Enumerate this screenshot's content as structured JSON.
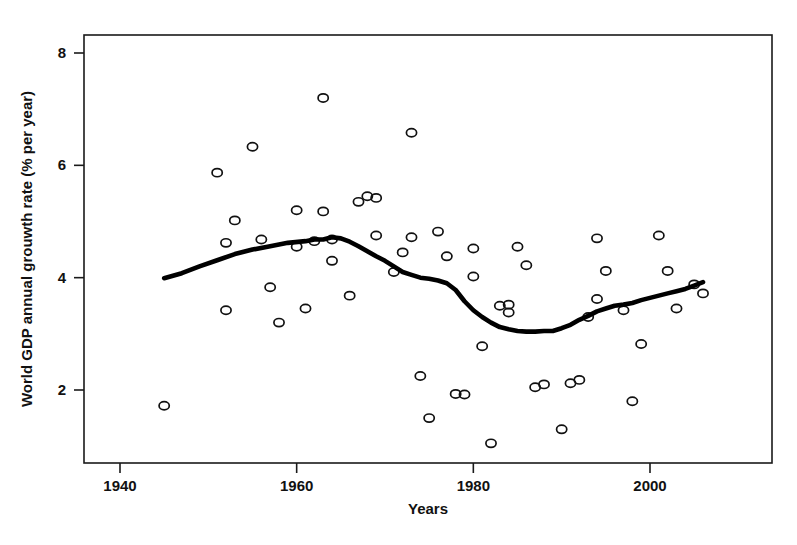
{
  "chart_data": {
    "type": "scatter",
    "title": "",
    "xlabel": "Years",
    "ylabel": "World GDP annual grouwth rate  (% per year)",
    "xlim": [
      1931,
      2009
    ],
    "ylim": [
      0.55,
      8.6
    ],
    "xticks": [
      1940,
      1960,
      1980,
      2000
    ],
    "xtick_labels": [
      "1940",
      "1960",
      "1980",
      "2000"
    ],
    "yticks": [
      2,
      4,
      6,
      8
    ],
    "ytick_labels": [
      "2",
      "4",
      "6",
      "8"
    ],
    "grid": false,
    "legend": "none",
    "marker": "open-circle",
    "series": [
      {
        "name": "World GDP annual growth rate",
        "type": "scatter",
        "points": [
          {
            "x": 1945,
            "y": 1.72
          },
          {
            "x": 1951,
            "y": 5.87
          },
          {
            "x": 1952,
            "y": 4.62
          },
          {
            "x": 1952,
            "y": 3.42
          },
          {
            "x": 1953,
            "y": 5.02
          },
          {
            "x": 1955,
            "y": 6.33
          },
          {
            "x": 1956,
            "y": 4.68
          },
          {
            "x": 1957,
            "y": 3.83
          },
          {
            "x": 1958,
            "y": 3.2
          },
          {
            "x": 1960,
            "y": 5.2
          },
          {
            "x": 1960,
            "y": 4.55
          },
          {
            "x": 1961,
            "y": 3.45
          },
          {
            "x": 1962,
            "y": 4.65
          },
          {
            "x": 1963,
            "y": 7.2
          },
          {
            "x": 1963,
            "y": 5.18
          },
          {
            "x": 1964,
            "y": 4.68
          },
          {
            "x": 1964,
            "y": 4.3
          },
          {
            "x": 1966,
            "y": 3.68
          },
          {
            "x": 1967,
            "y": 5.35
          },
          {
            "x": 1968,
            "y": 5.45
          },
          {
            "x": 1969,
            "y": 5.42
          },
          {
            "x": 1969,
            "y": 4.75
          },
          {
            "x": 1971,
            "y": 4.1
          },
          {
            "x": 1972,
            "y": 4.45
          },
          {
            "x": 1973,
            "y": 6.58
          },
          {
            "x": 1973,
            "y": 4.72
          },
          {
            "x": 1974,
            "y": 2.25
          },
          {
            "x": 1975,
            "y": 1.5
          },
          {
            "x": 1976,
            "y": 4.82
          },
          {
            "x": 1977,
            "y": 4.38
          },
          {
            "x": 1978,
            "y": 1.93
          },
          {
            "x": 1979,
            "y": 1.92
          },
          {
            "x": 1980,
            "y": 4.02
          },
          {
            "x": 1980,
            "y": 4.52
          },
          {
            "x": 1981,
            "y": 2.78
          },
          {
            "x": 1982,
            "y": 1.05
          },
          {
            "x": 1983,
            "y": 3.5
          },
          {
            "x": 1984,
            "y": 3.38
          },
          {
            "x": 1984,
            "y": 3.52
          },
          {
            "x": 1985,
            "y": 4.55
          },
          {
            "x": 1986,
            "y": 4.22
          },
          {
            "x": 1987,
            "y": 2.05
          },
          {
            "x": 1988,
            "y": 2.1
          },
          {
            "x": 1990,
            "y": 1.3
          },
          {
            "x": 1991,
            "y": 2.12
          },
          {
            "x": 1992,
            "y": 2.18
          },
          {
            "x": 1993,
            "y": 3.3
          },
          {
            "x": 1994,
            "y": 4.7
          },
          {
            "x": 1994,
            "y": 3.62
          },
          {
            "x": 1995,
            "y": 4.12
          },
          {
            "x": 1997,
            "y": 3.42
          },
          {
            "x": 1998,
            "y": 1.8
          },
          {
            "x": 1999,
            "y": 2.82
          },
          {
            "x": 2001,
            "y": 4.75
          },
          {
            "x": 2002,
            "y": 4.12
          },
          {
            "x": 2003,
            "y": 3.45
          },
          {
            "x": 2005,
            "y": 3.88
          },
          {
            "x": 2006,
            "y": 3.72
          }
        ]
      },
      {
        "name": "Smoothed trend (lowess)",
        "type": "line",
        "points": [
          {
            "x": 1945,
            "y": 3.99
          },
          {
            "x": 1947,
            "y": 4.08
          },
          {
            "x": 1949,
            "y": 4.2
          },
          {
            "x": 1951,
            "y": 4.31
          },
          {
            "x": 1953,
            "y": 4.42
          },
          {
            "x": 1955,
            "y": 4.5
          },
          {
            "x": 1957,
            "y": 4.56
          },
          {
            "x": 1959,
            "y": 4.62
          },
          {
            "x": 1961,
            "y": 4.65
          },
          {
            "x": 1962,
            "y": 4.68
          },
          {
            "x": 1963,
            "y": 4.68
          },
          {
            "x": 1964,
            "y": 4.72
          },
          {
            "x": 1965,
            "y": 4.7
          },
          {
            "x": 1966,
            "y": 4.64
          },
          {
            "x": 1967,
            "y": 4.56
          },
          {
            "x": 1968,
            "y": 4.47
          },
          {
            "x": 1969,
            "y": 4.38
          },
          {
            "x": 1970,
            "y": 4.3
          },
          {
            "x": 1971,
            "y": 4.2
          },
          {
            "x": 1972,
            "y": 4.1
          },
          {
            "x": 1973,
            "y": 4.05
          },
          {
            "x": 1974,
            "y": 4.0
          },
          {
            "x": 1975,
            "y": 3.98
          },
          {
            "x": 1976,
            "y": 3.95
          },
          {
            "x": 1977,
            "y": 3.9
          },
          {
            "x": 1978,
            "y": 3.78
          },
          {
            "x": 1979,
            "y": 3.58
          },
          {
            "x": 1980,
            "y": 3.42
          },
          {
            "x": 1981,
            "y": 3.3
          },
          {
            "x": 1982,
            "y": 3.2
          },
          {
            "x": 1983,
            "y": 3.12
          },
          {
            "x": 1984,
            "y": 3.08
          },
          {
            "x": 1985,
            "y": 3.05
          },
          {
            "x": 1986,
            "y": 3.04
          },
          {
            "x": 1987,
            "y": 3.04
          },
          {
            "x": 1988,
            "y": 3.05
          },
          {
            "x": 1989,
            "y": 3.05
          },
          {
            "x": 1990,
            "y": 3.1
          },
          {
            "x": 1991,
            "y": 3.16
          },
          {
            "x": 1992,
            "y": 3.25
          },
          {
            "x": 1993,
            "y": 3.32
          },
          {
            "x": 1994,
            "y": 3.4
          },
          {
            "x": 1995,
            "y": 3.45
          },
          {
            "x": 1996,
            "y": 3.5
          },
          {
            "x": 1997,
            "y": 3.52
          },
          {
            "x": 1998,
            "y": 3.55
          },
          {
            "x": 1999,
            "y": 3.6
          },
          {
            "x": 2000,
            "y": 3.64
          },
          {
            "x": 2001,
            "y": 3.68
          },
          {
            "x": 2002,
            "y": 3.72
          },
          {
            "x": 2003,
            "y": 3.76
          },
          {
            "x": 2004,
            "y": 3.8
          },
          {
            "x": 2005,
            "y": 3.86
          },
          {
            "x": 2006,
            "y": 3.92
          }
        ]
      }
    ]
  },
  "axes": {
    "x_axis_title": "Years",
    "y_axis_title": "World GDP annual grouwth rate  (% per year)"
  },
  "colors": {
    "foreground": "#111111",
    "background": "#ffffff",
    "trend_line": "#000000"
  }
}
